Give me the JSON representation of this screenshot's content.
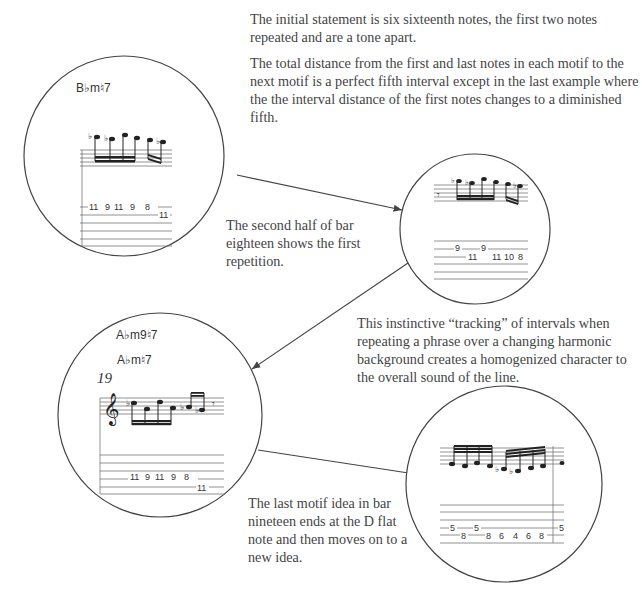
{
  "text": {
    "intro_p1": "The initial statement is six sixteenth notes, the first two notes repeated and are a tone apart.",
    "intro_p2": "The total distance from the first and last notes in each motif to the next motif is a perfect fifth interval except in the last example where the the interval distance of the first notes changes to a diminished fifth.",
    "second_half": "The second half of bar eighteen shows the first repetition.",
    "tracking": "This instinctive “tracking” of intervals when repeating a phrase over a changing harmonic background creates a homogenized character to the overall sound of the line.",
    "last_motif": "The last motif idea in bar nineteen ends at the D flat note and then moves on to a new idea."
  },
  "excerpts": [
    {
      "id": "circle-1",
      "chord": "B♭m♮7",
      "tab": [
        "11",
        "9",
        "11",
        "9",
        "8",
        "11"
      ]
    },
    {
      "id": "circle-2",
      "chord": "",
      "tab_top": [
        "9",
        "9"
      ],
      "tab_bottom": [
        "11",
        "11",
        "10",
        "8"
      ]
    },
    {
      "id": "circle-3",
      "chords": [
        "A♭m9♮7",
        "A♭m♮7"
      ],
      "bar_number": "19",
      "tab": [
        "11",
        "9",
        "11",
        "9",
        "8",
        "11"
      ]
    },
    {
      "id": "circle-4",
      "tab_top": [
        "5",
        "5",
        "5"
      ],
      "tab_bottom": [
        "8",
        "8",
        "6",
        "4",
        "6",
        "8"
      ]
    }
  ],
  "colors": {
    "ink": "#333333",
    "text": "#444444",
    "staff": "#777777"
  }
}
